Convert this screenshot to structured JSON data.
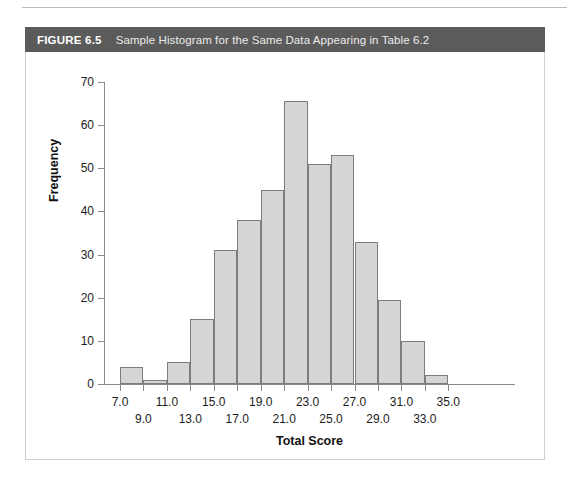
{
  "figure": {
    "label": "FIGURE 6.5",
    "caption": "Sample Histogram for the Same Data Appearing in Table 6.2",
    "header_color": "#5b5b5b"
  },
  "chart_data": {
    "type": "bar",
    "title": "Sample Histogram for the Same Data Appearing in Table 6.2",
    "xlabel": "Total Score",
    "ylabel": "Frequency",
    "xlim": [
      6,
      36
    ],
    "ylim": [
      0,
      70
    ],
    "grid": false,
    "legend": null,
    "bar_fill_color": "#d5d5d5",
    "bar_edge_color": "#7d7d7d",
    "bin_width": 2,
    "bin_centers": [
      8,
      10,
      12,
      14,
      16,
      18,
      20,
      22,
      24,
      26,
      28,
      30,
      32,
      34
    ],
    "bin_ranges": [
      "7-9",
      "9-11",
      "11-13",
      "13-15",
      "15-17",
      "17-19",
      "19-21",
      "21-23",
      "23-25",
      "25-27",
      "27-29",
      "29-31",
      "31-33",
      "33-35"
    ],
    "values": [
      4,
      1,
      5,
      15,
      31,
      38,
      45,
      65.5,
      51,
      53,
      33,
      19.5,
      10,
      2
    ],
    "y_ticks": [
      0,
      10,
      20,
      30,
      40,
      50,
      60,
      70
    ],
    "y_tick_labels": [
      "0",
      "10",
      "20",
      "30",
      "40",
      "50",
      "60",
      "70"
    ],
    "x_ticks": [
      7,
      9,
      11,
      13,
      15,
      17,
      19,
      21,
      23,
      25,
      27,
      29,
      31,
      33,
      35
    ],
    "x_tick_labels": [
      "7.0",
      "9.0",
      "11.0",
      "13.0",
      "15.0",
      "17.0",
      "19.0",
      "21.0",
      "23.0",
      "25.0",
      "27.0",
      "29.0",
      "31.0",
      "33.0",
      "35.0"
    ],
    "x_tick_label_rows": [
      0,
      1,
      0,
      1,
      0,
      1,
      0,
      1,
      0,
      1,
      0,
      1,
      0,
      1,
      0
    ]
  }
}
